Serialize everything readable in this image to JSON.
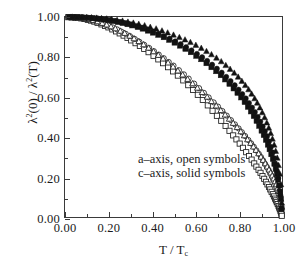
{
  "figure": {
    "background": "#ffffff",
    "foreground": "#1a1a1a",
    "width": 299,
    "height": 270
  },
  "axes": {
    "x_title_html": "T / T<sub>c</sub>",
    "y_title_html": "&lambda;<sup>2</sup>(0) / &lambda;<sup>2</sup>(T)",
    "x_ticks": [
      "0.00",
      "0.20",
      "0.40",
      "0.60",
      "0.80",
      "1.00"
    ],
    "y_ticks": [
      "0.00",
      "0.20",
      "0.40",
      "0.60",
      "0.80",
      "1.00"
    ]
  },
  "legend": {
    "line1": "a–axis, open symbols",
    "line2": "c–axis, solid symbols"
  },
  "chart_data": {
    "type": "scatter",
    "title": "",
    "xlabel": "T / Tc",
    "ylabel": "lambda^2(0) / lambda^2(T)",
    "xlim": [
      0.0,
      1.0
    ],
    "ylim": [
      0.0,
      1.0
    ],
    "grid": false,
    "legend_position": "inside-center",
    "legend_entries": [
      "a–axis, open symbols",
      "c–axis, solid symbols"
    ],
    "marker_color_open": "#ffffff",
    "marker_edge_color": "#1a1a1a",
    "marker_color_solid": "#111111",
    "series": [
      {
        "name": "a-axis open squares",
        "marker": "square",
        "fill": "open",
        "x": [
          0.015,
          0.03,
          0.045,
          0.06,
          0.075,
          0.09,
          0.105,
          0.12,
          0.135,
          0.15,
          0.168,
          0.185,
          0.2,
          0.218,
          0.235,
          0.252,
          0.27,
          0.288,
          0.305,
          0.325,
          0.345,
          0.365,
          0.385,
          0.408,
          0.43,
          0.452,
          0.475,
          0.498,
          0.52,
          0.545,
          0.568,
          0.59,
          0.612,
          0.635,
          0.658,
          0.68,
          0.7,
          0.72,
          0.74,
          0.758,
          0.775,
          0.79,
          0.805,
          0.82,
          0.835,
          0.848,
          0.86,
          0.872,
          0.882,
          0.892,
          0.901,
          0.91,
          0.918,
          0.926,
          0.933,
          0.94,
          0.946,
          0.952,
          0.958,
          0.963,
          0.968,
          0.972,
          0.976,
          0.98,
          0.984,
          0.987,
          0.99,
          0.993,
          0.995,
          0.997,
          0.999
        ],
        "y": [
          0.999,
          0.998,
          0.997,
          0.995,
          0.993,
          0.99,
          0.986,
          0.982,
          0.977,
          0.971,
          0.963,
          0.955,
          0.948,
          0.938,
          0.928,
          0.918,
          0.907,
          0.895,
          0.883,
          0.869,
          0.855,
          0.84,
          0.824,
          0.806,
          0.788,
          0.769,
          0.749,
          0.728,
          0.707,
          0.683,
          0.659,
          0.635,
          0.611,
          0.585,
          0.558,
          0.531,
          0.506,
          0.481,
          0.455,
          0.431,
          0.408,
          0.388,
          0.367,
          0.346,
          0.324,
          0.305,
          0.287,
          0.268,
          0.252,
          0.236,
          0.221,
          0.205,
          0.191,
          0.176,
          0.163,
          0.15,
          0.138,
          0.126,
          0.114,
          0.103,
          0.092,
          0.083,
          0.074,
          0.065,
          0.055,
          0.047,
          0.039,
          0.03,
          0.023,
          0.015,
          0.006
        ]
      },
      {
        "name": "a-axis open circles",
        "marker": "circle",
        "fill": "open",
        "x": [
          0.022,
          0.04,
          0.058,
          0.075,
          0.093,
          0.11,
          0.128,
          0.145,
          0.163,
          0.182,
          0.2,
          0.22,
          0.24,
          0.26,
          0.28,
          0.3,
          0.322,
          0.343,
          0.365,
          0.388,
          0.41,
          0.432,
          0.455,
          0.478,
          0.5,
          0.525,
          0.548,
          0.57,
          0.595,
          0.618,
          0.64,
          0.662,
          0.685,
          0.705,
          0.725,
          0.745,
          0.765,
          0.783,
          0.8,
          0.815,
          0.83,
          0.845,
          0.858,
          0.87,
          0.882,
          0.893,
          0.903,
          0.913,
          0.922,
          0.93,
          0.938,
          0.945,
          0.952,
          0.958,
          0.964,
          0.97,
          0.975,
          0.98,
          0.985,
          0.989,
          0.993,
          0.996,
          0.998
        ],
        "y": [
          0.999,
          0.998,
          0.996,
          0.994,
          0.991,
          0.987,
          0.983,
          0.978,
          0.972,
          0.965,
          0.957,
          0.948,
          0.938,
          0.927,
          0.916,
          0.904,
          0.89,
          0.876,
          0.861,
          0.845,
          0.829,
          0.812,
          0.794,
          0.775,
          0.757,
          0.734,
          0.713,
          0.692,
          0.667,
          0.644,
          0.621,
          0.598,
          0.573,
          0.552,
          0.53,
          0.507,
          0.484,
          0.463,
          0.443,
          0.424,
          0.405,
          0.385,
          0.368,
          0.351,
          0.333,
          0.316,
          0.3,
          0.283,
          0.266,
          0.251,
          0.236,
          0.221,
          0.206,
          0.192,
          0.177,
          0.162,
          0.147,
          0.131,
          0.114,
          0.098,
          0.08,
          0.06,
          0.04
        ]
      },
      {
        "name": "a-axis open triangles",
        "marker": "triangle",
        "fill": "open",
        "x": [
          0.03,
          0.05,
          0.07,
          0.09,
          0.11,
          0.13,
          0.15,
          0.172,
          0.192,
          0.212,
          0.232,
          0.255,
          0.275,
          0.298,
          0.318,
          0.34,
          0.362,
          0.385,
          0.408,
          0.43,
          0.452,
          0.475,
          0.498,
          0.52,
          0.542,
          0.565,
          0.588,
          0.61,
          0.632,
          0.655,
          0.675,
          0.697,
          0.718,
          0.738,
          0.757,
          0.775,
          0.793,
          0.81,
          0.826,
          0.841,
          0.855,
          0.868,
          0.88,
          0.892,
          0.903,
          0.913,
          0.923,
          0.932,
          0.94,
          0.948,
          0.955,
          0.962,
          0.968,
          0.974,
          0.98,
          0.985,
          0.99,
          0.994,
          0.998
        ],
        "y": [
          0.998,
          0.997,
          0.995,
          0.992,
          0.988,
          0.983,
          0.977,
          0.969,
          0.961,
          0.952,
          0.942,
          0.93,
          0.919,
          0.905,
          0.892,
          0.878,
          0.862,
          0.845,
          0.827,
          0.809,
          0.791,
          0.771,
          0.751,
          0.731,
          0.711,
          0.689,
          0.667,
          0.645,
          0.623,
          0.6,
          0.578,
          0.556,
          0.533,
          0.511,
          0.49,
          0.469,
          0.448,
          0.427,
          0.407,
          0.387,
          0.369,
          0.351,
          0.334,
          0.317,
          0.3,
          0.284,
          0.267,
          0.251,
          0.236,
          0.221,
          0.206,
          0.191,
          0.177,
          0.162,
          0.145,
          0.129,
          0.11,
          0.09,
          0.05
        ]
      },
      {
        "name": "c-axis solid squares",
        "marker": "square",
        "fill": "solid",
        "x": [
          0.018,
          0.036,
          0.054,
          0.072,
          0.09,
          0.108,
          0.126,
          0.145,
          0.163,
          0.182,
          0.2,
          0.222,
          0.243,
          0.265,
          0.288,
          0.31,
          0.335,
          0.358,
          0.382,
          0.405,
          0.43,
          0.455,
          0.48,
          0.505,
          0.53,
          0.555,
          0.58,
          0.605,
          0.628,
          0.652,
          0.675,
          0.697,
          0.718,
          0.738,
          0.758,
          0.777,
          0.795,
          0.812,
          0.828,
          0.843,
          0.857,
          0.87,
          0.883,
          0.895,
          0.906,
          0.916,
          0.926,
          0.935,
          0.943,
          0.951,
          0.958,
          0.965,
          0.971,
          0.977,
          0.982,
          0.987,
          0.991,
          0.995,
          0.998
        ],
        "y": [
          1.0,
          0.999,
          0.999,
          0.998,
          0.997,
          0.996,
          0.994,
          0.992,
          0.99,
          0.987,
          0.984,
          0.98,
          0.975,
          0.97,
          0.964,
          0.958,
          0.95,
          0.942,
          0.932,
          0.922,
          0.911,
          0.899,
          0.886,
          0.872,
          0.857,
          0.841,
          0.824,
          0.806,
          0.789,
          0.769,
          0.749,
          0.729,
          0.709,
          0.688,
          0.666,
          0.643,
          0.621,
          0.598,
          0.575,
          0.551,
          0.528,
          0.505,
          0.481,
          0.456,
          0.432,
          0.41,
          0.386,
          0.362,
          0.339,
          0.314,
          0.291,
          0.266,
          0.241,
          0.214,
          0.187,
          0.158,
          0.127,
          0.09,
          0.04
        ]
      },
      {
        "name": "c-axis solid circles",
        "marker": "circle",
        "fill": "solid",
        "x": [
          0.025,
          0.045,
          0.065,
          0.085,
          0.105,
          0.125,
          0.148,
          0.168,
          0.19,
          0.212,
          0.235,
          0.258,
          0.282,
          0.305,
          0.33,
          0.355,
          0.38,
          0.405,
          0.43,
          0.455,
          0.482,
          0.508,
          0.533,
          0.558,
          0.583,
          0.608,
          0.632,
          0.655,
          0.678,
          0.7,
          0.722,
          0.743,
          0.763,
          0.782,
          0.8,
          0.817,
          0.833,
          0.848,
          0.862,
          0.875,
          0.888,
          0.9,
          0.911,
          0.921,
          0.931,
          0.94,
          0.949,
          0.957,
          0.964,
          0.971,
          0.977,
          0.983,
          0.988,
          0.993,
          0.997
        ],
        "y": [
          1.0,
          0.999,
          0.999,
          0.998,
          0.997,
          0.995,
          0.993,
          0.991,
          0.988,
          0.984,
          0.98,
          0.975,
          0.969,
          0.963,
          0.955,
          0.947,
          0.938,
          0.928,
          0.917,
          0.905,
          0.892,
          0.878,
          0.864,
          0.849,
          0.833,
          0.816,
          0.799,
          0.781,
          0.762,
          0.742,
          0.722,
          0.701,
          0.68,
          0.659,
          0.637,
          0.615,
          0.593,
          0.57,
          0.547,
          0.525,
          0.501,
          0.477,
          0.453,
          0.429,
          0.404,
          0.378,
          0.351,
          0.323,
          0.294,
          0.263,
          0.23,
          0.194,
          0.155,
          0.108,
          0.045
        ]
      },
      {
        "name": "c-axis solid triangles",
        "marker": "triangle",
        "fill": "solid",
        "x": [
          0.033,
          0.055,
          0.078,
          0.1,
          0.122,
          0.145,
          0.168,
          0.192,
          0.215,
          0.24,
          0.265,
          0.29,
          0.315,
          0.34,
          0.367,
          0.393,
          0.42,
          0.447,
          0.473,
          0.5,
          0.527,
          0.553,
          0.578,
          0.603,
          0.628,
          0.652,
          0.675,
          0.698,
          0.72,
          0.741,
          0.761,
          0.78,
          0.798,
          0.815,
          0.831,
          0.846,
          0.86,
          0.874,
          0.886,
          0.898,
          0.909,
          0.92,
          0.93,
          0.939,
          0.948,
          0.956,
          0.964,
          0.971,
          0.978,
          0.984,
          0.99,
          0.995,
          0.999
        ],
        "y": [
          1.0,
          0.999,
          0.999,
          0.998,
          0.997,
          0.995,
          0.993,
          0.991,
          0.988,
          0.984,
          0.98,
          0.975,
          0.97,
          0.964,
          0.957,
          0.949,
          0.941,
          0.931,
          0.921,
          0.91,
          0.898,
          0.886,
          0.873,
          0.859,
          0.844,
          0.828,
          0.812,
          0.795,
          0.777,
          0.758,
          0.739,
          0.72,
          0.7,
          0.679,
          0.658,
          0.637,
          0.615,
          0.592,
          0.57,
          0.546,
          0.522,
          0.497,
          0.471,
          0.445,
          0.418,
          0.39,
          0.36,
          0.329,
          0.295,
          0.258,
          0.215,
          0.162,
          0.07
        ]
      }
    ]
  }
}
